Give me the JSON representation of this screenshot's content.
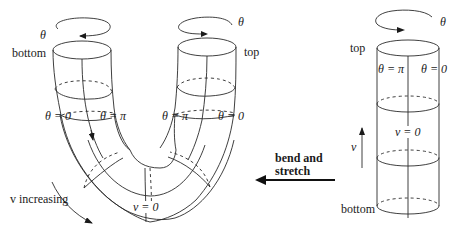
{
  "diagram": {
    "left_figure": {
      "name": "bent-cylinder",
      "labels": {
        "theta_left": "θ",
        "theta_right": "θ",
        "bottom": "bottom",
        "top": "top",
        "left_arm_theta0": "θ = 0",
        "left_arm_thetapi": "θ = π",
        "right_arm_thetapi": "θ = π",
        "right_arm_theta0": "θ = 0",
        "v_zero": "v = 0",
        "v_increasing": "v increasing"
      }
    },
    "transform_arrow": {
      "label_line1": "bend and",
      "label_line2": "stretch",
      "direction": "left"
    },
    "right_figure": {
      "name": "straight-cylinder",
      "labels": {
        "theta": "θ",
        "top": "top",
        "theta_pi": "θ = π",
        "theta_0": "θ = 0",
        "v_zero": "v = 0",
        "v_axis": "v",
        "bottom": "bottom"
      }
    }
  }
}
